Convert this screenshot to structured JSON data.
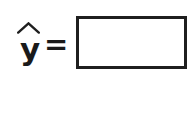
{
  "canvas": {
    "width_px": 195,
    "height_px": 115,
    "background_color": "#ffffff"
  },
  "equation": {
    "response_symbol": "y",
    "response_symbol_accent": "hat",
    "response_symbol_full": "ŷ",
    "relation_operator": "=",
    "ink_color": "#1f1f1f",
    "answer_blank": {
      "value": "",
      "placeholder": "",
      "is_empty": true,
      "border_color": "#1f1f1f",
      "border_width_px": 3,
      "fill_color": "#ffffff",
      "width_px": 105,
      "height_px": 47
    }
  }
}
